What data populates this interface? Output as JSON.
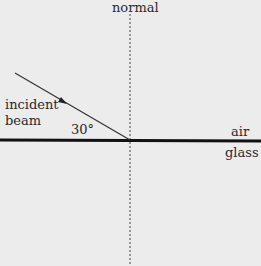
{
  "diagram": {
    "labels": {
      "normal": "normal",
      "incident_line1": "incident",
      "incident_line2": "beam",
      "angle": "30°",
      "air": "air",
      "glass": "glass"
    },
    "geometry": {
      "interface_y": 140,
      "normal_x": 130,
      "beam_start": [
        15,
        73
      ],
      "beam_end": [
        130,
        140
      ],
      "angle_degrees": 30
    },
    "colors": {
      "background": "#ececec",
      "interface": "#111111",
      "beam": "#333333",
      "normal": "#444444"
    }
  }
}
